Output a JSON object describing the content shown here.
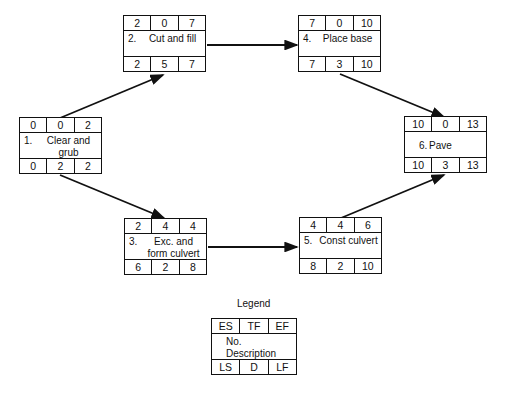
{
  "nodes": [
    {
      "id": "1",
      "no": "1.",
      "desc": "Clear and grub",
      "es": "0",
      "tf": "0",
      "ef": "2",
      "ls": "0",
      "d": "2",
      "lf": "2"
    },
    {
      "id": "2",
      "no": "2.",
      "desc": "Cut and fill",
      "es": "2",
      "tf": "0",
      "ef": "7",
      "ls": "2",
      "d": "5",
      "lf": "7"
    },
    {
      "id": "3",
      "no": "3.",
      "desc": "Exc. and form culvert",
      "es": "2",
      "tf": "4",
      "ef": "4",
      "ls": "6",
      "d": "2",
      "lf": "8"
    },
    {
      "id": "4",
      "no": "4.",
      "desc": "Place base",
      "es": "7",
      "tf": "0",
      "ef": "10",
      "ls": "7",
      "d": "3",
      "lf": "10"
    },
    {
      "id": "5",
      "no": "5.",
      "desc": "Const culvert",
      "es": "4",
      "tf": "4",
      "ef": "6",
      "ls": "8",
      "d": "2",
      "lf": "10"
    },
    {
      "id": "6",
      "no": "6.",
      "desc": "Pave",
      "es": "10",
      "tf": "0",
      "ef": "13",
      "ls": "10",
      "d": "3",
      "lf": "13"
    }
  ],
  "edges": [
    {
      "from": "1",
      "to": "2"
    },
    {
      "from": "1",
      "to": "3"
    },
    {
      "from": "2",
      "to": "4"
    },
    {
      "from": "3",
      "to": "5"
    },
    {
      "from": "4",
      "to": "6"
    },
    {
      "from": "5",
      "to": "6"
    }
  ],
  "legend": {
    "title": "Legend",
    "es": "ES",
    "tf": "TF",
    "ef": "EF",
    "no": "No.",
    "desc": "Description",
    "ls": "LS",
    "d": "D",
    "lf": "LF"
  }
}
